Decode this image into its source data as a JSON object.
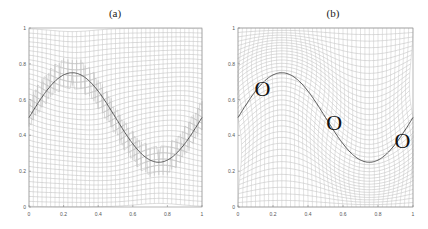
{
  "chart_data": [
    {
      "type": "line",
      "title": "(a)",
      "xlabel": "",
      "ylabel": "",
      "xlim": [
        0,
        1
      ],
      "ylim": [
        0,
        1
      ],
      "x_ticks": [
        "0",
        "0.2",
        "0.4",
        "0.6",
        "0.8",
        "1"
      ],
      "y_ticks": [
        "0",
        "0.2",
        "0.4",
        "0.6",
        "0.8",
        "1"
      ],
      "grid": "deformed mesh (adaptive mesh lines concentrated near interface)",
      "series": [
        {
          "name": "interface",
          "function": "y = 0.5 + 0.25*sin(2*pi*x)",
          "x": [
            0,
            0.25,
            0.5,
            0.75,
            1
          ],
          "y": [
            0.5,
            0.75,
            0.5,
            0.25,
            0.5
          ]
        }
      ]
    },
    {
      "type": "line",
      "title": "(b)",
      "xlabel": "",
      "ylabel": "",
      "xlim": [
        0,
        1
      ],
      "ylim": [
        0,
        1
      ],
      "x_ticks": [
        "0",
        "0.2",
        "0.4",
        "0.6",
        "0.8",
        "1"
      ],
      "y_ticks": [
        "0",
        "0.2",
        "0.4",
        "0.6",
        "0.8",
        "1"
      ],
      "grid": "deformed mesh (mesh lines aligned along interface)",
      "series": [
        {
          "name": "interface",
          "function": "y = 0.5 + 0.25*sin(2*pi*x)",
          "x": [
            0,
            0.25,
            0.5,
            0.75,
            1
          ],
          "y": [
            0.5,
            0.75,
            0.5,
            0.25,
            0.5
          ]
        }
      ],
      "annotations": [
        {
          "text": "O",
          "x": 0.14,
          "y": 0.66
        },
        {
          "text": "O",
          "x": 0.55,
          "y": 0.47
        },
        {
          "text": "O",
          "x": 0.94,
          "y": 0.37
        }
      ]
    }
  ],
  "panels": {
    "a": {
      "title": "(a)"
    },
    "b": {
      "title": "(b)",
      "marker": "O"
    }
  }
}
